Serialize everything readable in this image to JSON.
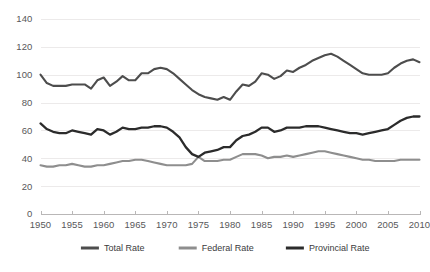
{
  "chart_data": {
    "type": "line",
    "title": "",
    "subtitle": "",
    "xlabel": "",
    "ylabel": "",
    "xlim": [
      1950,
      2010
    ],
    "ylim": [
      0,
      140
    ],
    "grid": true,
    "legend_position": "bottom",
    "y_ticks": [
      "0",
      "20",
      "40",
      "60",
      "80",
      "100",
      "120",
      "140"
    ],
    "y_tick_values": [
      0,
      20,
      40,
      60,
      80,
      100,
      120,
      140
    ],
    "x_ticks": [
      "1950",
      "1955",
      "1960",
      "1965",
      "1970",
      "1975",
      "1980",
      "1985",
      "1990",
      "1995",
      "2000",
      "2005",
      "2010"
    ],
    "x_tick_values": [
      1950,
      1955,
      1960,
      1965,
      1970,
      1975,
      1980,
      1985,
      1990,
      1995,
      2000,
      2005,
      2010
    ],
    "x": [
      1950,
      1951,
      1952,
      1953,
      1954,
      1955,
      1956,
      1957,
      1958,
      1959,
      1960,
      1961,
      1962,
      1963,
      1964,
      1965,
      1966,
      1967,
      1968,
      1969,
      1970,
      1971,
      1972,
      1973,
      1974,
      1975,
      1976,
      1977,
      1978,
      1979,
      1980,
      1981,
      1982,
      1983,
      1984,
      1985,
      1986,
      1987,
      1988,
      1989,
      1990,
      1991,
      1992,
      1993,
      1994,
      1995,
      1996,
      1997,
      1998,
      1999,
      2000,
      2001,
      2002,
      2003,
      2004,
      2005,
      2006,
      2007,
      2008,
      2009,
      2010
    ],
    "series": [
      {
        "name": "Total Rate",
        "color": "#4d4d4d",
        "values": [
          100,
          94,
          92,
          92,
          92,
          93,
          93,
          93,
          90,
          96,
          98,
          92,
          95,
          99,
          96,
          96,
          101,
          101,
          104,
          105,
          104,
          101,
          97,
          93,
          89,
          86,
          84,
          83,
          82,
          84,
          82,
          88,
          93,
          92,
          95,
          101,
          100,
          97,
          99,
          103,
          102,
          105,
          107,
          110,
          112,
          114,
          115,
          113,
          110,
          107,
          104,
          101,
          100,
          100,
          100,
          101,
          105,
          108,
          110,
          111,
          109
        ]
      },
      {
        "name": "Federal Rate",
        "color": "#8e8e8e",
        "values": [
          35,
          34,
          34,
          35,
          35,
          36,
          35,
          34,
          34,
          35,
          35,
          36,
          37,
          38,
          38,
          39,
          39,
          38,
          37,
          36,
          35,
          35,
          35,
          35,
          36,
          41,
          38,
          38,
          38,
          39,
          39,
          41,
          43,
          43,
          43,
          42,
          40,
          41,
          41,
          42,
          41,
          42,
          43,
          44,
          45,
          45,
          44,
          43,
          42,
          41,
          40,
          39,
          39,
          38,
          38,
          38,
          38,
          39,
          39,
          39,
          39
        ]
      },
      {
        "name": "Provincial Rate",
        "color": "#2b2b2b",
        "values": [
          65,
          61,
          59,
          58,
          58,
          60,
          59,
          58,
          57,
          61,
          60,
          57,
          59,
          62,
          61,
          61,
          62,
          62,
          63,
          63,
          62,
          59,
          55,
          48,
          43,
          41,
          44,
          45,
          46,
          48,
          48,
          53,
          56,
          57,
          59,
          62,
          62,
          59,
          60,
          62,
          62,
          62,
          63,
          63,
          63,
          62,
          61,
          60,
          59,
          58,
          58,
          57,
          58,
          59,
          60,
          61,
          64,
          67,
          69,
          70,
          70
        ]
      }
    ]
  },
  "legend": {
    "items": [
      {
        "label": "Total Rate",
        "color": "#4d4d4d"
      },
      {
        "label": "Federal Rate",
        "color": "#8e8e8e"
      },
      {
        "label": "Provincial Rate",
        "color": "#2b2b2b"
      }
    ]
  },
  "colors": {
    "background": "#ffffff",
    "gridline": "#eceaea",
    "axis": "#b9b7b7",
    "tick_text": "#58585a",
    "legend_text": "#3b3b3d"
  }
}
